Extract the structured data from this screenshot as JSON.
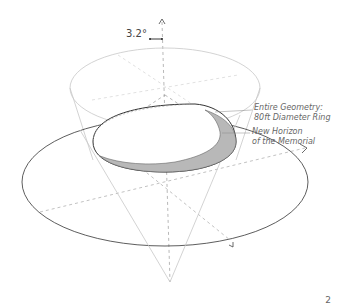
{
  "diagram": {
    "angle_label": "3.2°",
    "annotations": [
      {
        "line1": "Entire Geometry:",
        "line2": "80ft Diameter Ring"
      },
      {
        "line1": "New Horizon",
        "line2": "of the Memorial"
      }
    ],
    "page_number": "2",
    "colors": {
      "outline_dark": "#444444",
      "outline_light": "#bbbbbb",
      "ring_fill": "#b8b8b8",
      "dashed": "#999999"
    }
  }
}
